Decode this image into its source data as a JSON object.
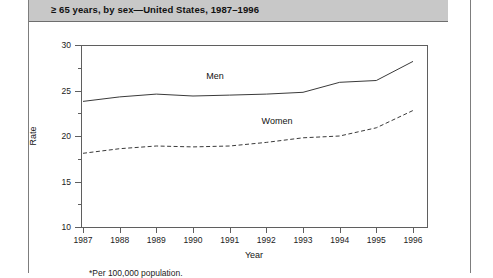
{
  "page": {
    "title_banner": "≥ 65 years, by sex—United States, 1987–1996",
    "footnote": "*Per 100,000 population."
  },
  "chart_data": {
    "type": "line",
    "title": "≥ 65 years, by sex—United States, 1987–1996",
    "xlabel": "Year",
    "ylabel": "Rate",
    "xlim": [
      1987,
      1996
    ],
    "ylim": [
      10,
      30
    ],
    "yticks": [
      10,
      15,
      20,
      25,
      30
    ],
    "ytick_labels": [
      "10",
      "15",
      "20",
      "25",
      "30"
    ],
    "grid": false,
    "legend": "inline-labels",
    "annotations": [
      "Men",
      "Women"
    ],
    "footnote": "*Per 100,000 population.",
    "categories": [
      1987,
      1988,
      1989,
      1990,
      1991,
      1992,
      1993,
      1994,
      1995,
      1996
    ],
    "xtick_labels": [
      "1987",
      "1988",
      "1989",
      "1990",
      "1991",
      "1992",
      "1993",
      "1994",
      "1995",
      "1996"
    ],
    "series": [
      {
        "name": "Men",
        "style": "solid",
        "color": "#3a3a3a",
        "values": [
          23.8,
          24.3,
          24.6,
          24.4,
          24.5,
          24.6,
          24.8,
          25.9,
          26.1,
          28.2
        ]
      },
      {
        "name": "Women",
        "style": "dashed",
        "color": "#3a3a3a",
        "values": [
          18.1,
          18.6,
          18.9,
          18.8,
          18.9,
          19.3,
          19.8,
          20.0,
          20.9,
          22.8
        ]
      }
    ]
  }
}
